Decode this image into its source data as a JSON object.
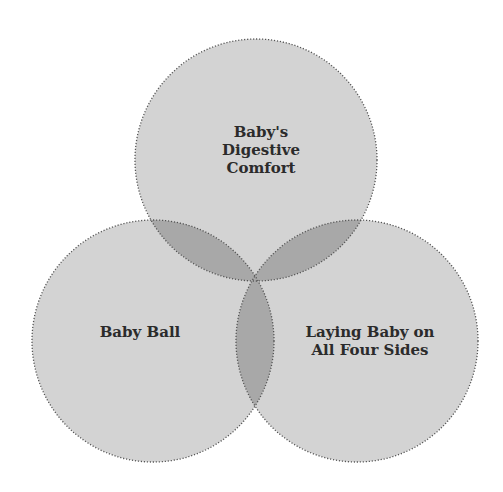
{
  "diagram": {
    "type": "venn",
    "sets": [
      {
        "id": "top",
        "label_lines": [
          "Baby's",
          "Digestive",
          "Comfort"
        ],
        "cx": 256,
        "cy": 160,
        "r": 121
      },
      {
        "id": "left",
        "label_lines": [
          "Baby Ball"
        ],
        "cx": 153,
        "cy": 341,
        "r": 121
      },
      {
        "id": "right",
        "label_lines": [
          "Laying Baby on",
          "All Four Sides"
        ],
        "cx": 357,
        "cy": 341,
        "r": 121
      }
    ],
    "colors": {
      "fill": "#d3d3d3",
      "overlap": "#a8a8a8",
      "stroke": "#555555",
      "text": "#2b2b2b"
    }
  }
}
